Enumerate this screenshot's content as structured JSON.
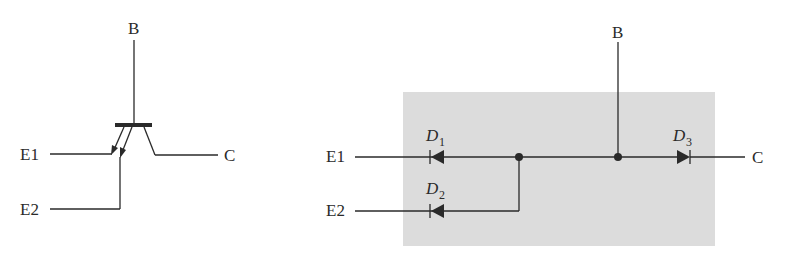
{
  "left_symbol": {
    "title": "Multi-emitter transistor symbol",
    "labels": {
      "base": "B",
      "emitter1": "E1",
      "emitter2": "E2",
      "collector": "C"
    }
  },
  "right_equivalent": {
    "title": "Diode equivalent circuit",
    "labels": {
      "base": "B",
      "emitter1": "E1",
      "emitter2": "E2",
      "collector": "C"
    },
    "diodes": [
      {
        "name": "D",
        "sub": "1",
        "orientation": "pointing-left"
      },
      {
        "name": "D",
        "sub": "2",
        "orientation": "pointing-left"
      },
      {
        "name": "D",
        "sub": "3",
        "orientation": "pointing-right"
      }
    ],
    "colors": {
      "background_box": "#dcdcdc",
      "line": "#2a2a2a"
    }
  }
}
